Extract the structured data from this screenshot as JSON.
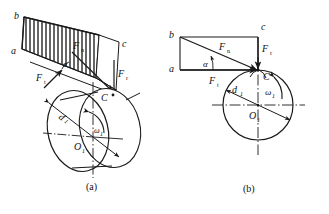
{
  "figure": {
    "stroke_color": "#1a1a1a",
    "hatch_color": "#333333",
    "background": "#ffffff",
    "panels": [
      {
        "id": "a",
        "caption": "(a)",
        "description": "three-dimensional view of cylindrical gear with distributed load plane",
        "labels": {
          "b": "b",
          "a": "a",
          "c": "c",
          "Fn": "F",
          "Fn_sub": "n",
          "Ft": "F",
          "Ft_sub": "t",
          "Fr": "F",
          "Fr_sub": "r",
          "C": "C",
          "d1": "d",
          "d1_sub": "1",
          "omega1": "ω",
          "omega1_sub": "1",
          "O1": "O",
          "O1_sub": "1",
          "alpha": "α"
        }
      },
      {
        "id": "b",
        "caption": "(b)",
        "description": "plane force decomposition triangle with pitch circle",
        "labels": {
          "b": "b",
          "a": "a",
          "c": "c",
          "Fn": "F",
          "Fn_sub": "n",
          "Ft": "F",
          "Ft_sub": "t",
          "Fr": "F",
          "Fr_sub": "r",
          "C": "C",
          "d1": "d",
          "d1_sub": "1",
          "omega1": "ω",
          "omega1_sub": "1",
          "O1": "O",
          "O1_sub": "1",
          "alpha": "α"
        }
      }
    ]
  }
}
